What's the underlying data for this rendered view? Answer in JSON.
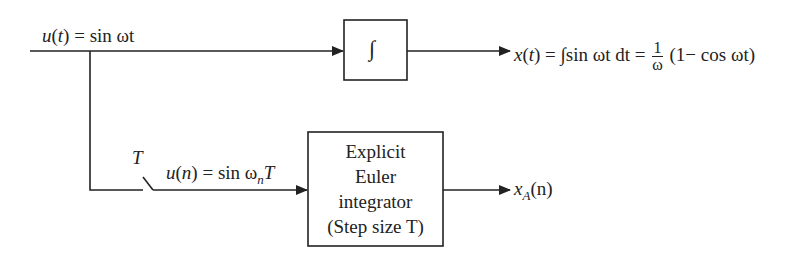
{
  "input_label": {
    "lhs": "u",
    "arg": "t",
    "rhs": "sin ωt"
  },
  "integrator_block": {
    "symbol": "∫"
  },
  "output_continuous": {
    "lhs": "x",
    "arg": "t",
    "integral": "∫sin ωt dt =",
    "frac_num": "1",
    "frac_den": "ω",
    "tail": "(1− cos ωt)"
  },
  "sampler": {
    "label": "T"
  },
  "sampled_label": {
    "lhs": "u",
    "arg": "n",
    "rhs": "sin ω",
    "sub": "n",
    "tail": "T"
  },
  "euler_block": {
    "lines": [
      "Explicit",
      "Euler",
      "integrator",
      "(Step size T)"
    ]
  },
  "output_discrete": {
    "var": "x",
    "sub": "A",
    "arg": "(n)"
  }
}
